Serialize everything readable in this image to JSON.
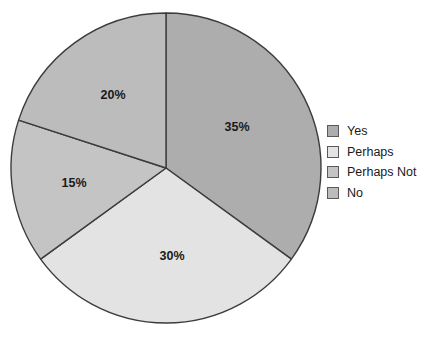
{
  "chart_data": {
    "type": "pie",
    "title": "",
    "subtitle": "",
    "xlabel": "",
    "ylabel": "",
    "legend_position": "right",
    "grid": false,
    "start_angle_deg": 0,
    "direction": "clockwise",
    "categories": [
      "Yes",
      "Perhaps",
      "Perhaps Not",
      "No"
    ],
    "values": [
      35,
      30,
      15,
      20
    ],
    "value_unit": "%",
    "data_labels": [
      "35%",
      "30%",
      "15%",
      "20%"
    ],
    "colors": [
      "#adadad",
      "#e3e3e3",
      "#c4c4c4",
      "#bcbcbc"
    ],
    "slice_border_color": "#3c3c3c",
    "slices": [
      {
        "name": "Yes",
        "value": 35,
        "label": "35%",
        "color": "#adadad",
        "label_x": 237,
        "label_y": 128
      },
      {
        "name": "Perhaps",
        "value": 30,
        "label": "30%",
        "color": "#e3e3e3",
        "label_x": 172,
        "label_y": 257
      },
      {
        "name": "Perhaps Not",
        "value": 15,
        "label": "15%",
        "color": "#c4c4c4",
        "label_x": 74,
        "label_y": 184
      },
      {
        "name": "No",
        "value": 20,
        "label": "20%",
        "color": "#bcbcbc",
        "label_x": 113,
        "label_y": 96
      }
    ]
  },
  "legend": {
    "items": [
      {
        "label": "Yes",
        "color": "#adadad"
      },
      {
        "label": "Perhaps",
        "color": "#e3e3e3"
      },
      {
        "label": "Perhaps Not",
        "color": "#c4c4c4"
      },
      {
        "label": "No",
        "color": "#bcbcbc"
      }
    ]
  },
  "geometry": {
    "center_x": 166,
    "center_y": 168,
    "radius": 155
  }
}
